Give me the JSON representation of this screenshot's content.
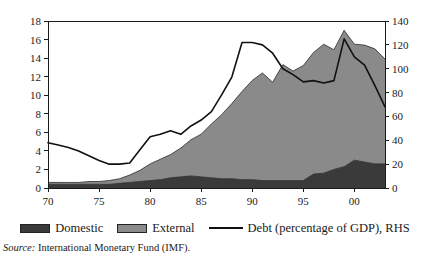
{
  "chart_data": {
    "type": "area",
    "title": "",
    "subtitle": "",
    "xlabel": "",
    "ylabel": "",
    "grid": false,
    "legend_position": "bottom",
    "x": [
      1970,
      1971,
      1972,
      1973,
      1974,
      1975,
      1976,
      1977,
      1978,
      1979,
      1980,
      1981,
      1982,
      1983,
      1984,
      1985,
      1986,
      1987,
      1988,
      1989,
      1990,
      1991,
      1992,
      1993,
      1994,
      1995,
      1996,
      1997,
      1998,
      1999,
      2000,
      2001,
      2002,
      2003
    ],
    "x_tick_values": [
      1970,
      1975,
      1980,
      1985,
      1990,
      1995,
      2000
    ],
    "x_tick_labels": [
      "70",
      "75",
      "80",
      "85",
      "90",
      "95",
      "00"
    ],
    "xlim": [
      1970,
      2003
    ],
    "left_axis": {
      "label": "",
      "ylim": [
        0,
        18
      ],
      "ticks": [
        0,
        2,
        4,
        6,
        8,
        10,
        12,
        14,
        16,
        18
      ],
      "tick_labels": [
        "0",
        "2",
        "4",
        "6",
        "8",
        "10",
        "12",
        "14",
        "16",
        "18"
      ]
    },
    "right_axis": {
      "label": "",
      "ylim": [
        0,
        140
      ],
      "ticks": [
        0,
        20,
        40,
        60,
        80,
        100,
        120,
        140
      ],
      "tick_labels": [
        "0",
        "20",
        "40",
        "60",
        "80",
        "100",
        "120",
        "140"
      ]
    },
    "series": [
      {
        "name": "Domestic",
        "type": "stacked-area",
        "axis": "left",
        "color": "#3a3a3a",
        "values": [
          0.4,
          0.4,
          0.4,
          0.4,
          0.4,
          0.4,
          0.4,
          0.5,
          0.6,
          0.7,
          0.8,
          0.9,
          1.1,
          1.2,
          1.3,
          1.2,
          1.1,
          1.0,
          1.0,
          0.9,
          0.9,
          0.8,
          0.8,
          0.8,
          0.8,
          0.8,
          1.5,
          1.6,
          2.0,
          2.3,
          3.0,
          2.8,
          2.6,
          2.6
        ]
      },
      {
        "name": "External",
        "type": "stacked-area",
        "axis": "left",
        "color": "#8a8a8a",
        "values": [
          0.2,
          0.2,
          0.2,
          0.2,
          0.3,
          0.3,
          0.4,
          0.5,
          0.8,
          1.2,
          1.8,
          2.2,
          2.5,
          3.1,
          3.9,
          4.6,
          5.8,
          6.9,
          8.1,
          9.5,
          10.7,
          11.6,
          10.6,
          12.5,
          11.8,
          12.4,
          13.1,
          13.9,
          12.9,
          14.7,
          12.5,
          12.6,
          12.4,
          11.3
        ]
      },
      {
        "name": "Debt (percentage of GDP), RHS",
        "type": "line",
        "axis": "right",
        "color": "#111111",
        "values": [
          38,
          36,
          34,
          31,
          27,
          23,
          20,
          20,
          21,
          32,
          43,
          45,
          48,
          45,
          52,
          57,
          64,
          78,
          93,
          122,
          122,
          120,
          113,
          100,
          95,
          89,
          90,
          88,
          90,
          125,
          110,
          103,
          86,
          68
        ]
      }
    ]
  },
  "legend": {
    "entries": [
      {
        "label": "Domestic",
        "swatch": "#3a3a3a",
        "style": "swatch"
      },
      {
        "label": "External",
        "swatch": "#8a8a8a",
        "style": "swatch"
      },
      {
        "label": "Debt (percentage of GDP), RHS",
        "swatch": "#111111",
        "style": "line"
      }
    ]
  },
  "source": {
    "label": "Source:",
    "text": "International Monetary Fund (IMF)."
  }
}
